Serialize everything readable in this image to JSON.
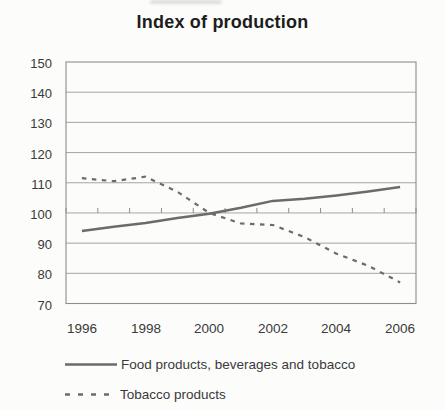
{
  "title": "Index of production",
  "chart_data": {
    "type": "line",
    "x": [
      1996,
      1997,
      1998,
      1999,
      2000,
      2001,
      2002,
      2003,
      2004,
      2005,
      2006
    ],
    "series": [
      {
        "name": "Food products, beverages and tobacco",
        "style": "solid",
        "values": [
          94,
          95.4,
          96.7,
          98.3,
          99.7,
          101.7,
          104,
          104.7,
          105.8,
          107.1,
          108.6
        ]
      },
      {
        "name": "Tobacco products",
        "style": "dashed",
        "values": [
          111.5,
          110.5,
          112,
          107,
          100,
          96.5,
          96,
          92,
          86.5,
          82.5,
          77
        ]
      }
    ],
    "ylim": [
      70,
      150
    ],
    "yticks": [
      150,
      140,
      130,
      120,
      110,
      100,
      90,
      80,
      70
    ],
    "xtick_labels": [
      "1996",
      "1998",
      "2000",
      "2002",
      "2004",
      "2006"
    ],
    "xtick_every": 2,
    "baseline": 100,
    "grid": true,
    "legend_position": "bottom-left",
    "colors": {
      "line": "#6b6b6b",
      "grid": "#9b9b9b",
      "text": "#3a3a3a",
      "title": "#1d1d1d",
      "background": "#fcfcfa"
    }
  }
}
